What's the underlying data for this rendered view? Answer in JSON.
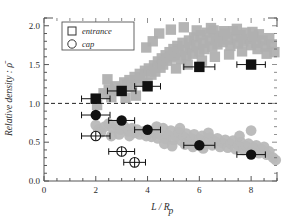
{
  "chart_data": {
    "type": "scatter",
    "title": "",
    "xlabel": "L / R_p",
    "ylabel": "Relative density : ρ̄",
    "xlim": [
      0,
      9
    ],
    "ylim": [
      0.0,
      2.1
    ],
    "xticks": [
      0,
      2,
      4,
      6,
      8
    ],
    "xtick_labels": [
      "0",
      "2",
      "4",
      "6",
      "8"
    ],
    "yticks": [
      0.0,
      0.5,
      1.0,
      1.5,
      2.0
    ],
    "ytick_labels": [
      "0.0",
      "0.5",
      "1.0",
      "1.5",
      "2.0"
    ],
    "xminor_step": 0.5,
    "yminor_step": 0.1,
    "grid": false,
    "reference_line": {
      "y": 1.0,
      "style": "dashed",
      "color": "#222222"
    },
    "legend": {
      "position": "top-left",
      "entries": [
        {
          "label": "entrance",
          "marker": "open-square"
        },
        {
          "label": "cap",
          "marker": "open-circle"
        }
      ]
    },
    "colors": {
      "cloud_square": "#b0b0b0",
      "cloud_circle": "#b8b8b8",
      "marker_black": "#111111",
      "axis": "#555555",
      "background": "#ffffff"
    },
    "series": [
      {
        "name": "entrance-cloud",
        "marker": "square",
        "color": "#b0b0b0",
        "points": [
          [
            2.0,
            1.06
          ],
          [
            2.05,
            0.98
          ],
          [
            2.3,
            1.13
          ],
          [
            2.5,
            1.18
          ],
          [
            2.6,
            1.08
          ],
          [
            2.75,
            1.22
          ],
          [
            2.9,
            1.16
          ],
          [
            3.0,
            1.19
          ],
          [
            3.1,
            1.27
          ],
          [
            3.2,
            1.24
          ],
          [
            3.3,
            1.3
          ],
          [
            3.4,
            1.21
          ],
          [
            3.5,
            1.34
          ],
          [
            3.6,
            1.29
          ],
          [
            3.7,
            1.38
          ],
          [
            3.8,
            1.33
          ],
          [
            3.9,
            1.42
          ],
          [
            4.0,
            1.26
          ],
          [
            4.05,
            1.45
          ],
          [
            4.15,
            1.37
          ],
          [
            4.25,
            1.49
          ],
          [
            4.3,
            1.41
          ],
          [
            4.4,
            1.54
          ],
          [
            4.5,
            1.46
          ],
          [
            4.55,
            1.58
          ],
          [
            4.6,
            1.5
          ],
          [
            4.7,
            1.62
          ],
          [
            4.75,
            1.55
          ],
          [
            4.85,
            1.66
          ],
          [
            4.9,
            1.59
          ],
          [
            5.0,
            1.7
          ],
          [
            5.05,
            1.62
          ],
          [
            5.15,
            1.74
          ],
          [
            5.2,
            1.66
          ],
          [
            5.3,
            1.57
          ],
          [
            5.35,
            1.78
          ],
          [
            5.45,
            1.69
          ],
          [
            5.5,
            1.61
          ],
          [
            5.6,
            1.81
          ],
          [
            5.65,
            1.72
          ],
          [
            5.75,
            1.64
          ],
          [
            5.8,
            1.85
          ],
          [
            5.9,
            1.75
          ],
          [
            6.0,
            1.67
          ],
          [
            6.05,
            1.88
          ],
          [
            6.15,
            1.78
          ],
          [
            6.2,
            1.7
          ],
          [
            6.3,
            1.91
          ],
          [
            6.4,
            1.81
          ],
          [
            6.5,
            1.73
          ],
          [
            6.55,
            1.94
          ],
          [
            6.65,
            1.84
          ],
          [
            6.7,
            1.76
          ],
          [
            6.8,
            1.87
          ],
          [
            6.9,
            1.79
          ],
          [
            7.0,
            1.9
          ],
          [
            7.1,
            1.82
          ],
          [
            7.2,
            1.74
          ],
          [
            7.3,
            1.93
          ],
          [
            7.4,
            1.85
          ],
          [
            7.5,
            1.77
          ],
          [
            7.6,
            1.88
          ],
          [
            7.7,
            1.8
          ],
          [
            7.8,
            1.91
          ],
          [
            7.9,
            1.83
          ],
          [
            8.0,
            1.75
          ],
          [
            8.1,
            1.86
          ],
          [
            8.2,
            1.78
          ],
          [
            8.3,
            1.89
          ],
          [
            8.45,
            1.81
          ],
          [
            8.55,
            1.73
          ],
          [
            8.7,
            1.84
          ],
          [
            8.8,
            1.76
          ],
          [
            8.9,
            1.66
          ],
          [
            4.45,
            1.9
          ],
          [
            4.9,
            1.95
          ],
          [
            5.4,
            1.98
          ],
          [
            5.9,
            1.94
          ],
          [
            6.45,
            1.97
          ],
          [
            6.95,
            1.93
          ],
          [
            7.45,
            1.96
          ],
          [
            8.05,
            1.92
          ],
          [
            3.95,
            1.72
          ],
          [
            4.2,
            1.8
          ],
          [
            3.55,
            1.1
          ],
          [
            3.15,
            1.07
          ],
          [
            2.45,
            1.31
          ],
          [
            5.1,
            1.45
          ],
          [
            5.55,
            1.5
          ],
          [
            6.1,
            1.55
          ],
          [
            6.6,
            1.6
          ],
          [
            7.15,
            1.63
          ],
          [
            7.65,
            1.67
          ],
          [
            8.25,
            1.7
          ],
          [
            8.6,
            1.64
          ]
        ]
      },
      {
        "name": "cap-cloud",
        "marker": "circle",
        "color": "#b8b8b8",
        "points": [
          [
            2.0,
            0.72
          ],
          [
            2.1,
            0.66
          ],
          [
            2.2,
            0.63
          ],
          [
            2.35,
            0.7
          ],
          [
            2.5,
            0.74
          ],
          [
            2.65,
            0.68
          ],
          [
            2.8,
            0.72
          ],
          [
            2.95,
            0.66
          ],
          [
            3.1,
            0.7
          ],
          [
            3.25,
            0.64
          ],
          [
            3.4,
            0.68
          ],
          [
            3.5,
            0.62
          ],
          [
            3.6,
            0.66
          ],
          [
            3.7,
            0.6
          ],
          [
            3.85,
            0.64
          ],
          [
            3.95,
            0.58
          ],
          [
            4.05,
            0.63
          ],
          [
            4.15,
            0.57
          ],
          [
            4.3,
            0.61
          ],
          [
            4.4,
            0.55
          ],
          [
            4.5,
            0.6
          ],
          [
            4.6,
            0.68
          ],
          [
            4.7,
            0.54
          ],
          [
            4.8,
            0.59
          ],
          [
            4.9,
            0.65
          ],
          [
            5.0,
            0.53
          ],
          [
            5.1,
            0.58
          ],
          [
            5.2,
            0.63
          ],
          [
            5.3,
            0.52
          ],
          [
            5.4,
            0.57
          ],
          [
            5.5,
            0.61
          ],
          [
            5.6,
            0.5
          ],
          [
            5.7,
            0.55
          ],
          [
            5.8,
            0.6
          ],
          [
            5.9,
            0.49
          ],
          [
            6.0,
            0.54
          ],
          [
            6.1,
            0.58
          ],
          [
            6.2,
            0.47
          ],
          [
            6.3,
            0.52
          ],
          [
            6.4,
            0.56
          ],
          [
            6.5,
            0.46
          ],
          [
            6.6,
            0.51
          ],
          [
            6.7,
            0.55
          ],
          [
            6.8,
            0.44
          ],
          [
            6.9,
            0.49
          ],
          [
            7.0,
            0.53
          ],
          [
            7.1,
            0.43
          ],
          [
            7.2,
            0.48
          ],
          [
            7.3,
            0.52
          ],
          [
            7.4,
            0.41
          ],
          [
            7.5,
            0.46
          ],
          [
            7.6,
            0.5
          ],
          [
            7.7,
            0.4
          ],
          [
            7.8,
            0.45
          ],
          [
            7.9,
            0.48
          ],
          [
            8.0,
            0.38
          ],
          [
            8.1,
            0.43
          ],
          [
            8.2,
            0.46
          ],
          [
            8.3,
            0.36
          ],
          [
            8.4,
            0.41
          ],
          [
            8.5,
            0.44
          ],
          [
            8.6,
            0.34
          ],
          [
            8.7,
            0.38
          ],
          [
            8.85,
            0.3
          ],
          [
            8.95,
            0.27
          ],
          [
            8.0,
            0.65
          ],
          [
            7.55,
            0.58
          ],
          [
            6.35,
            0.62
          ],
          [
            5.25,
            0.68
          ],
          [
            4.65,
            0.48
          ],
          [
            5.75,
            0.44
          ],
          [
            6.15,
            0.42
          ],
          [
            4.35,
            0.7
          ],
          [
            3.3,
            0.58
          ],
          [
            2.9,
            0.6
          ],
          [
            2.6,
            0.58
          ],
          [
            4.95,
            0.45
          ],
          [
            5.45,
            0.47
          ]
        ]
      },
      {
        "name": "entrance",
        "marker": "filled-square",
        "color": "#111111",
        "points": [
          {
            "x": 2.0,
            "y": 1.06,
            "xerr": 0.55
          },
          {
            "x": 3.0,
            "y": 1.16,
            "xerr": 0.55
          },
          {
            "x": 4.0,
            "y": 1.22,
            "xerr": 0.5
          },
          {
            "x": 6.0,
            "y": 1.47,
            "xerr": 0.6
          },
          {
            "x": 8.0,
            "y": 1.5,
            "xerr": 0.55
          }
        ]
      },
      {
        "name": "cap-filled",
        "marker": "filled-circle",
        "color": "#111111",
        "points": [
          {
            "x": 2.0,
            "y": 0.85,
            "xerr": 0.55
          },
          {
            "x": 3.0,
            "y": 0.78,
            "xerr": 0.5
          },
          {
            "x": 4.0,
            "y": 0.66,
            "xerr": 0.5
          },
          {
            "x": 6.0,
            "y": 0.46,
            "xerr": 0.6
          },
          {
            "x": 8.0,
            "y": 0.34,
            "xerr": 0.55
          }
        ]
      },
      {
        "name": "cap-open",
        "marker": "crossed-circle",
        "color": "#111111",
        "points": [
          {
            "x": 2.0,
            "y": 0.58,
            "xerr": 0.55
          },
          {
            "x": 3.0,
            "y": 0.38,
            "xerr": 0.5
          },
          {
            "x": 3.5,
            "y": 0.24,
            "xerr": 0.42
          }
        ]
      }
    ]
  }
}
